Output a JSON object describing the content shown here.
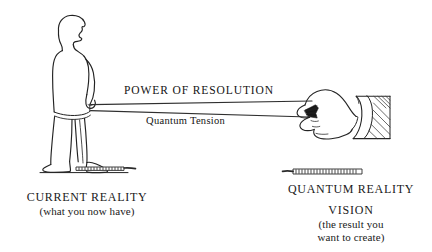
{
  "diagram": {
    "band": {
      "upper_label": "POWER OF RESOLUTION",
      "lower_label": "Quantum Tension"
    },
    "left_side": {
      "heading": "CURRENT REALITY",
      "subtext": "(what you now have)",
      "figure": "standing-person-silhouette",
      "anchor": "coil-spring-anchor"
    },
    "right_side": {
      "heading": "QUANTUM REALITY",
      "secondary_heading": "VISION",
      "subtext_line1": "(the result you",
      "subtext_line2": "want to create)",
      "figure": "hand-gripping-band",
      "anchor": "coil-spring-anchor"
    },
    "colors": {
      "background": "#ffffff",
      "ink": "#141414",
      "line": "#333333"
    }
  }
}
